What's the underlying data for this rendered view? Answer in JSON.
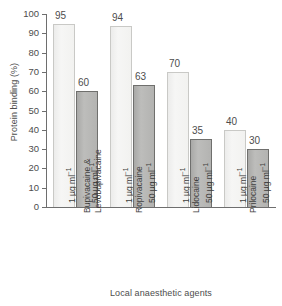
{
  "chart_data": {
    "type": "bar",
    "title": "",
    "xlabel": "Local anaesthetic agents",
    "ylabel": "Protein binding (%)",
    "ylim": [
      0,
      100
    ],
    "yticks": [
      0,
      10,
      20,
      30,
      40,
      50,
      60,
      70,
      80,
      90,
      100
    ],
    "grid": false,
    "legend": "none",
    "categories": [
      "Bupivacaine & Levobupivacaine",
      "Ropivacaine",
      "Lidocaine",
      "Prilocaine"
    ],
    "series": [
      {
        "name": "1 µg ml⁻¹",
        "values": [
          95,
          94,
          70,
          40
        ]
      },
      {
        "name": "50 µg ml⁻¹",
        "values": [
          60,
          63,
          35,
          30
        ]
      }
    ],
    "colors": {
      "series_1_fill": "#f2f2f0",
      "series_1_border": "#c9c9c6",
      "series_2_fill": "#b3b3b1",
      "series_2_border": "#6f6f6d",
      "axis": "#6e6e6e",
      "text": "#4d4d4d",
      "background": "#ffffff"
    }
  },
  "axes": {
    "y_title": "Protein binding (%)",
    "x_title": "Local anaesthetic agents",
    "y_ticks": [
      "100",
      "90",
      "80",
      "70",
      "60",
      "50",
      "40",
      "30",
      "20",
      "10",
      "0"
    ]
  },
  "groups": [
    {
      "category_line1": "Bupivacaine &",
      "category_line2": "Levobupivacaine",
      "bars": [
        {
          "dose_value": "1",
          "dose_unit": "µg ml",
          "dose_exp": "−1",
          "value": "95",
          "style": "light"
        },
        {
          "dose_value": "50",
          "dose_unit": "µg ml",
          "dose_exp": "−1",
          "value": "60",
          "style": "dark"
        }
      ]
    },
    {
      "category_line1": "Ropivacaine",
      "category_line2": "",
      "bars": [
        {
          "dose_value": "1",
          "dose_unit": "µg ml",
          "dose_exp": "−1",
          "value": "94",
          "style": "light"
        },
        {
          "dose_value": "50",
          "dose_unit": "µg ml",
          "dose_exp": "−1",
          "value": "63",
          "style": "dark"
        }
      ]
    },
    {
      "category_line1": "Lidocaine",
      "category_line2": "",
      "bars": [
        {
          "dose_value": "1",
          "dose_unit": "µg ml",
          "dose_exp": "−1",
          "value": "70",
          "style": "light"
        },
        {
          "dose_value": "50",
          "dose_unit": "µg ml",
          "dose_exp": "−1",
          "value": "35",
          "style": "dark"
        }
      ]
    },
    {
      "category_line1": "Prilocaine",
      "category_line2": "",
      "bars": [
        {
          "dose_value": "1",
          "dose_unit": "µg ml",
          "dose_exp": "−1",
          "value": "40",
          "style": "light"
        },
        {
          "dose_value": "50",
          "dose_unit": "µg ml",
          "dose_exp": "−1",
          "value": "30",
          "style": "dark"
        }
      ]
    }
  ]
}
